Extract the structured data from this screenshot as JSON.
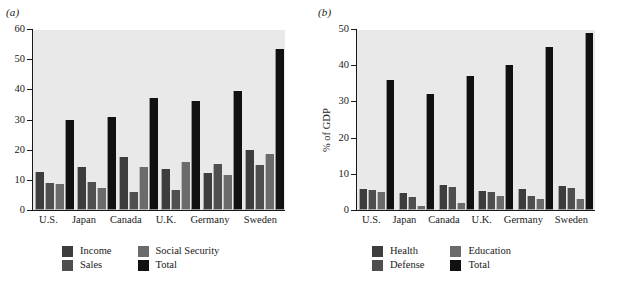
{
  "figure": {
    "panel_a_tag": "(a)",
    "panel_b_tag": "(b)"
  },
  "colors": {
    "plot_background": "#e9e9e9",
    "axis": "#191919",
    "series_1": "#3d3d3d",
    "series_2": "#4f4f4f",
    "series_3": "#6b6b6b",
    "series_total": "#111111"
  },
  "panel_a": {
    "tag": "(a)",
    "ylabel": "",
    "yticks": [
      "0",
      "10",
      "20",
      "30",
      "40",
      "50",
      "60"
    ],
    "xlabels": [
      "U.S.",
      "Japan",
      "Canada",
      "U.K.",
      "Germany",
      "Sweden"
    ],
    "legend": [
      {
        "label": "Income",
        "color": "#3d3d3d"
      },
      {
        "label": "Social Security",
        "color": "#6b6b6b"
      },
      {
        "label": "Sales",
        "color": "#4f4f4f"
      },
      {
        "label": "Total",
        "color": "#111111"
      }
    ]
  },
  "panel_b": {
    "tag": "(b)",
    "ylabel": "% of GDP",
    "yticks": [
      "0",
      "10",
      "20",
      "30",
      "40",
      "50"
    ],
    "xlabels": [
      "U.S.",
      "Japan",
      "Canada",
      "U.K.",
      "Germany",
      "Sweden"
    ],
    "legend": [
      {
        "label": "Health",
        "color": "#3d3d3d"
      },
      {
        "label": "Education",
        "color": "#6b6b6b"
      },
      {
        "label": "Defense",
        "color": "#4f4f4f"
      },
      {
        "label": "Total",
        "color": "#111111"
      }
    ]
  },
  "chart_data": [
    {
      "type": "bar",
      "panel": "(a)",
      "title": "",
      "xlabel": "",
      "ylabel": "",
      "ylim": [
        0,
        60
      ],
      "yticks": [
        0,
        10,
        20,
        30,
        40,
        50,
        60
      ],
      "grid": false,
      "legend_position": "below",
      "categories": [
        "U.S.",
        "Japan",
        "Canada",
        "U.K.",
        "Germany",
        "Sweden"
      ],
      "series": [
        {
          "name": "Income",
          "color": "#3d3d3d",
          "values": [
            12.5,
            14.3,
            17.5,
            13.6,
            12.3,
            20.0
          ]
        },
        {
          "name": "Sales",
          "color": "#4f4f4f",
          "values": [
            9.0,
            9.3,
            6.0,
            6.5,
            15.2,
            15.0
          ]
        },
        {
          "name": "Social Security",
          "color": "#6b6b6b",
          "values": [
            8.5,
            7.3,
            14.3,
            16.0,
            11.5,
            18.6
          ]
        },
        {
          "name": "Total",
          "color": "#111111",
          "values": [
            30.0,
            30.7,
            37.2,
            36.2,
            39.5,
            53.4
          ]
        }
      ]
    },
    {
      "type": "bar",
      "panel": "(b)",
      "title": "",
      "xlabel": "",
      "ylabel": "% of GDP",
      "ylim": [
        0,
        50
      ],
      "yticks": [
        0,
        10,
        20,
        30,
        40,
        50
      ],
      "grid": false,
      "legend_position": "below",
      "categories": [
        "U.S.",
        "Japan",
        "Canada",
        "U.K.",
        "Germany",
        "Sweden"
      ],
      "series": [
        {
          "name": "Health",
          "color": "#3d3d3d",
          "values": [
            5.8,
            4.6,
            7.0,
            5.3,
            5.8,
            6.5
          ]
        },
        {
          "name": "Defense",
          "color": "#4f4f4f",
          "values": [
            5.5,
            3.5,
            6.3,
            4.9,
            4.0,
            6.2
          ]
        },
        {
          "name": "Education",
          "color": "#6b6b6b",
          "values": [
            5.0,
            1.2,
            2.0,
            3.8,
            3.1,
            3.0
          ]
        },
        {
          "name": "Total",
          "color": "#111111",
          "values": [
            35.8,
            32.0,
            37.0,
            40.0,
            45.0,
            48.8
          ]
        }
      ]
    }
  ]
}
